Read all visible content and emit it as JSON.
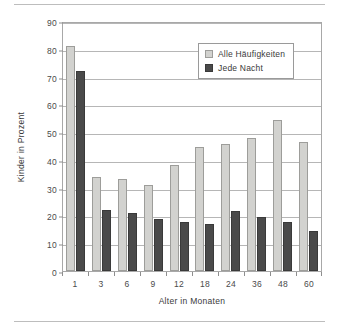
{
  "chart_data": {
    "type": "bar",
    "title": "",
    "xlabel": "Alter in Monaten",
    "ylabel": "Kinder in Prozent",
    "categories": [
      "1",
      "3",
      "6",
      "9",
      "12",
      "18",
      "24",
      "36",
      "48",
      "60"
    ],
    "ylim": [
      0,
      90
    ],
    "yticks": [
      0,
      10,
      20,
      30,
      40,
      50,
      60,
      70,
      80,
      90
    ],
    "grid": true,
    "legend_position": "top-right",
    "series": [
      {
        "name": "Alle Häufigkeiten",
        "color": "#d2d2cf",
        "values": [
          81,
          34,
          33,
          31,
          38,
          44.5,
          45.8,
          47.8,
          54.5,
          46.5
        ]
      },
      {
        "name": "Jede Nacht",
        "color": "#4a4a4a",
        "values": [
          72,
          22,
          20.8,
          18.7,
          17.8,
          16.8,
          21.7,
          19.5,
          17.7,
          14.5
        ]
      }
    ]
  }
}
